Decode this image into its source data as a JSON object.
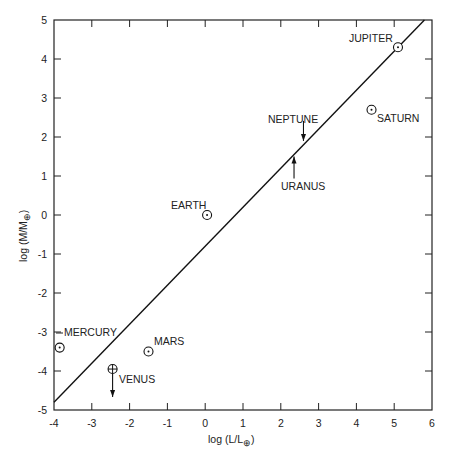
{
  "chart_data": {
    "type": "scatter",
    "title": "",
    "xlabel": "log (L/L⊕)",
    "ylabel": "log (M/M⊕)",
    "xlim": [
      -4,
      6
    ],
    "ylim": [
      -5,
      5
    ],
    "x_ticks": [
      "-4",
      "-3",
      "-2",
      "-1",
      "0",
      "1",
      "2",
      "3",
      "4",
      "5",
      "6"
    ],
    "y_ticks": [
      "5",
      "4",
      "3",
      "2",
      "1",
      "0",
      "-1",
      "-2",
      "-3",
      "-4",
      "-5"
    ],
    "grid": false,
    "legend": null,
    "points": [
      {
        "name": "MERCURY",
        "x": -3.85,
        "y": -3.4,
        "marker": "circle-dot"
      },
      {
        "name": "VENUS",
        "x": -2.45,
        "y": -3.95,
        "marker": "circle-plus",
        "upper_limit_arrow": "down"
      },
      {
        "name": "EARTH",
        "x": 0.05,
        "y": 0.0,
        "marker": "circle-dot"
      },
      {
        "name": "MARS",
        "x": -1.5,
        "y": -3.5,
        "marker": "circle-dot"
      },
      {
        "name": "JUPITER",
        "x": 5.1,
        "y": 4.3,
        "marker": "circle-dot"
      },
      {
        "name": "SATURN",
        "x": 4.4,
        "y": 2.7,
        "marker": "circle-dot"
      },
      {
        "name": "URANUS",
        "x": 2.35,
        "y": 1.5,
        "marker": "arrow-up"
      },
      {
        "name": "NEPTUNE",
        "x": 2.6,
        "y": 1.9,
        "marker": "arrow-down"
      }
    ],
    "fit_line": {
      "x": [
        -4,
        5.8
      ],
      "y": [
        -4.8,
        5.0
      ]
    }
  },
  "labels": {
    "mercury": "MERCURY",
    "venus": "VENUS",
    "earth": "EARTH",
    "mars": "MARS",
    "jupiter": "JUPITER",
    "saturn": "SATURN",
    "uranus": "URANUS",
    "neptune": "NEPTUNE"
  },
  "axes": {
    "xlabel_main": "log (L/L",
    "ylabel_main": "log (M/M",
    "sub": "⊕",
    "close": ")"
  }
}
